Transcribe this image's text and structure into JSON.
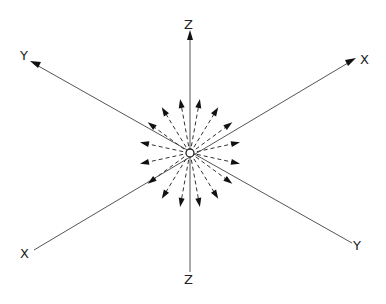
{
  "diagram": {
    "axes": [
      {
        "name": "z-axis",
        "label_top": "Z",
        "label_bottom": "Z"
      },
      {
        "name": "x-axis",
        "label_end": "X",
        "label_start": "X"
      },
      {
        "name": "y-axis",
        "label_end": "Y",
        "label_start": "Y"
      }
    ],
    "source": {
      "label": "point source",
      "shape": "open circle"
    },
    "ray_count": 16,
    "ray_style": "dashed arrows radiating outward",
    "colors": {
      "line": "#555555",
      "ray": "#333333",
      "arrowhead": "#111111",
      "background": "#ffffff"
    }
  }
}
